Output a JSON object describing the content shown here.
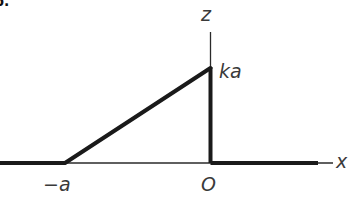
{
  "figure": {
    "tag": "b."
  },
  "axes": {
    "x_label": "x",
    "z_label": "z"
  },
  "labels": {
    "neg_a": "−a",
    "origin": "O",
    "peak": "ka"
  },
  "colors": {
    "line": "#1a1a1a",
    "axis": "#2a2a2a",
    "text": "#3a3a3a"
  },
  "function_segments": [
    {
      "from": "-∞",
      "to": "-a",
      "value": "0"
    },
    {
      "from": "-a",
      "to": "0",
      "value": "k(x + a)",
      "end_value": "ka"
    },
    {
      "from": "0",
      "to": "0",
      "value": "vertical drop ka → 0"
    },
    {
      "from": "0",
      "to": "+∞",
      "value": "0"
    }
  ]
}
